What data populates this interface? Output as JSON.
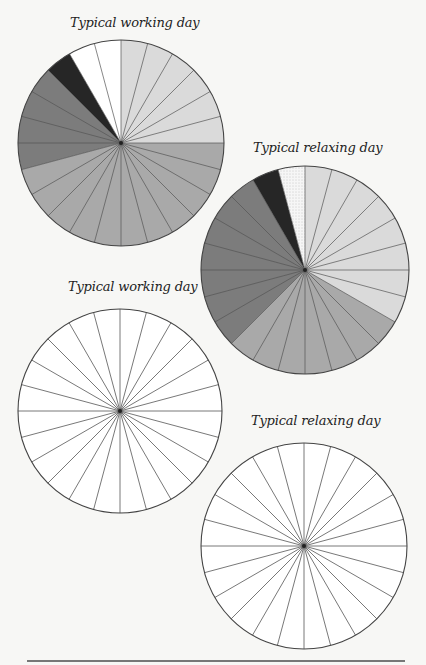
{
  "chart_data": [
    {
      "type": "pie",
      "title": "Typical working day",
      "variant": "filled",
      "segments_total": 24,
      "unit": "hours",
      "start_angle": "12 o'clock, clockwise",
      "slices": [
        {
          "category": "light",
          "hours": 6,
          "from_hour": 0,
          "to_hour": 6,
          "fill": "#dadada"
        },
        {
          "category": "medium",
          "hours": 11,
          "from_hour": 6,
          "to_hour": 17,
          "fill": "#a9a9a9"
        },
        {
          "category": "dark",
          "hours": 4,
          "from_hour": 17,
          "to_hour": 21,
          "fill": "#7c7c7c"
        },
        {
          "category": "black",
          "hours": 1,
          "from_hour": 21,
          "to_hour": 22,
          "fill": "#262626"
        },
        {
          "category": "white",
          "hours": 2,
          "from_hour": 22,
          "to_hour": 24,
          "fill": "#ffffff"
        }
      ]
    },
    {
      "type": "pie",
      "title": "Typical relaxing day",
      "variant": "filled",
      "segments_total": 24,
      "unit": "hours",
      "start_angle": "12 o'clock, clockwise",
      "slices": [
        {
          "category": "light",
          "hours": 8,
          "from_hour": 0,
          "to_hour": 8,
          "fill": "#dadada"
        },
        {
          "category": "medium",
          "hours": 7,
          "from_hour": 8,
          "to_hour": 15,
          "fill": "#a9a9a9"
        },
        {
          "category": "dark",
          "hours": 7,
          "from_hour": 15,
          "to_hour": 22,
          "fill": "#7c7c7c"
        },
        {
          "category": "black",
          "hours": 1,
          "from_hour": 22,
          "to_hour": 23,
          "fill": "#262626"
        },
        {
          "category": "dotted",
          "hours": 1,
          "from_hour": 23,
          "to_hour": 24,
          "fill": "#f4f4f4",
          "pattern": "dots"
        }
      ]
    },
    {
      "type": "pie",
      "title": "Typical working day",
      "variant": "blank",
      "segments_total": 24,
      "slices": []
    },
    {
      "type": "pie",
      "title": "Typical relaxing day",
      "variant": "blank",
      "segments_total": 24,
      "slices": []
    }
  ],
  "layout": {
    "charts": [
      {
        "cx": 121,
        "cy": 143,
        "r": 103,
        "title_x": 70,
        "title_y": 15
      },
      {
        "cx": 305,
        "cy": 270,
        "r": 104,
        "title_x": 253,
        "title_y": 140
      },
      {
        "cx": 120,
        "cy": 411,
        "r": 102,
        "title_x": 68,
        "title_y": 279
      },
      {
        "cx": 304,
        "cy": 546,
        "r": 103,
        "title_x": 251,
        "title_y": 413
      }
    ]
  },
  "colors": {
    "stroke": "#555555",
    "outline": "#444444",
    "black_fill": "#262626"
  }
}
